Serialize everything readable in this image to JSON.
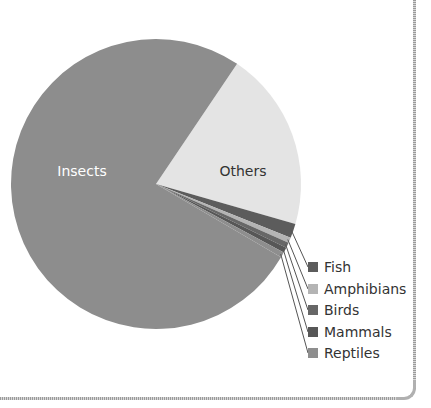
{
  "chart_data": {
    "type": "pie",
    "title": "",
    "start_angle_deg_clockwise_from_top": 34,
    "center": [
      156,
      184
    ],
    "radius": 145,
    "slices": [
      {
        "name": "Others",
        "value": 20.0,
        "color": "#e4e4e4",
        "label_inside": true,
        "label_pos": [
          243,
          176
        ],
        "label_color": "#333333"
      },
      {
        "name": "Fish",
        "value": 1.6,
        "color": "#5c5c5c",
        "label_inside": false,
        "legend_y": 267
      },
      {
        "name": "Amphibians",
        "value": 0.6,
        "color": "#b4b4b4",
        "label_inside": false,
        "legend_y": 289
      },
      {
        "name": "Birds",
        "value": 0.6,
        "color": "#676767",
        "label_inside": false,
        "legend_y": 310
      },
      {
        "name": "Mammals",
        "value": 0.6,
        "color": "#575757",
        "label_inside": false,
        "legend_y": 332
      },
      {
        "name": "Reptiles",
        "value": 0.6,
        "color": "#8e8e8e",
        "label_inside": false,
        "legend_y": 353
      },
      {
        "name": "Insects",
        "value": 76.0,
        "color": "#8d8d8d",
        "label_inside": true,
        "label_pos": [
          82,
          176
        ],
        "label_color": "#ffffff"
      }
    ],
    "legend": {
      "position": "right-bottom",
      "entries": [
        "Fish",
        "Amphibians",
        "Birds",
        "Mammals",
        "Reptiles"
      ],
      "square_x": 308,
      "text_x": 324
    }
  }
}
